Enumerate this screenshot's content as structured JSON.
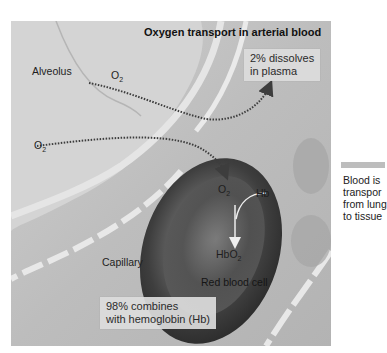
{
  "diagram": {
    "title": "Oxygen transport in arterial blood",
    "labels": {
      "alveolus": "Alveolus",
      "capillary": "Capillary",
      "red_blood_cell": "Red blood cell",
      "o2_top": "O",
      "o2_top_sub": "2",
      "o2_left": "O",
      "o2_left_sub": "2",
      "o2_cell": "O",
      "o2_cell_sub": "2",
      "hb": "Hb",
      "hbo2": "HbO",
      "hbo2_sub": "2"
    },
    "plasma_box": {
      "line1": "2% dissolves",
      "line2": "in plasma"
    },
    "hemoglobin_box": {
      "line1": "98% combines",
      "line2": "with hemoglobin (Hb)"
    },
    "side_note": {
      "line1": "Blood is",
      "line2": "transpor",
      "line3": "from lung",
      "line4": "to tissue"
    },
    "colors": {
      "background": "#c9c9c9",
      "capillary_wall": "#e6e6e6",
      "red_blood_cell": "#4a4a4a",
      "arrow": "#4a4a4a",
      "label_box": "#dcdcdc"
    }
  }
}
